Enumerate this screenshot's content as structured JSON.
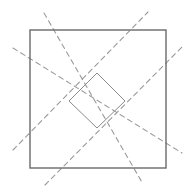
{
  "diagram": {
    "colors": {
      "background": "#ffffff",
      "outer_square_stroke": "#6a6a6a",
      "inner_diamond_stroke": "#8a8a8a",
      "dashed_line_stroke": "#9a9a9a"
    },
    "outer_square": {
      "x": 30,
      "y": 30,
      "width": 136,
      "height": 138
    },
    "inner_diamond": {
      "points": [
        [
          97,
          73
        ],
        [
          125,
          101
        ],
        [
          97,
          128
        ],
        [
          69,
          101
        ]
      ]
    },
    "dashed_lines": [
      {
        "name": "diag-down-upper",
        "x1": 44,
        "y1": 13,
        "x2": 143,
        "y2": 184
      },
      {
        "name": "diag-down-lower",
        "x1": 13,
        "y1": 48,
        "x2": 182,
        "y2": 153
      },
      {
        "name": "diag-up-upper",
        "x1": 13,
        "y1": 150,
        "x2": 148,
        "y2": 12
      },
      {
        "name": "diag-up-lower",
        "x1": 45,
        "y1": 185,
        "x2": 182,
        "y2": 47
      }
    ]
  }
}
